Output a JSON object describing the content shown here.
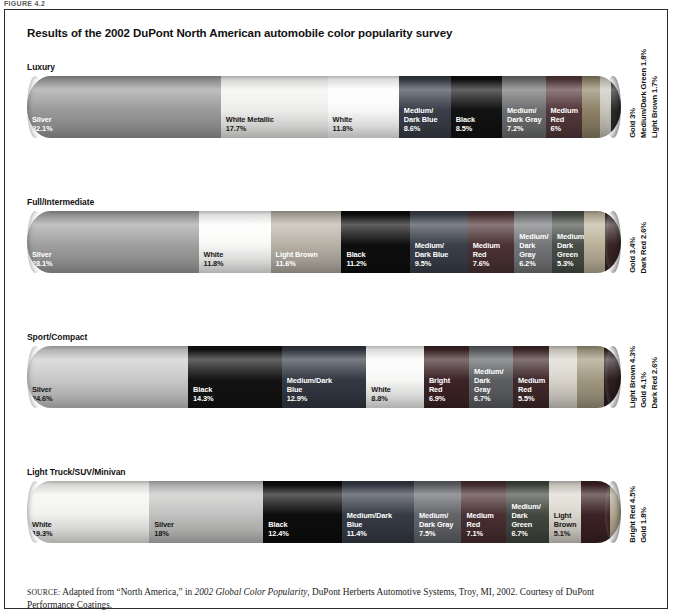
{
  "figure_label": "FIGURE 4.2",
  "title": "Results of the 2002 DuPont North American automobile color popularity survey",
  "source": {
    "prefix": "SOURCE:",
    "text_before_italic": " Adapted from “North America,” in ",
    "italic": "2002 Global Color Popularity",
    "text_after_italic": ", DuPont Herberts Automotive Systems, Troy, MI, 2002. Courtesy of DuPont Performance Coatings."
  },
  "chart_data": {
    "type": "bar",
    "subtype": "stacked-horizontal-100-percent",
    "title": "Results of the 2002 DuPont North American automobile color popularity survey",
    "xlabel": "",
    "ylabel": "",
    "units": "percent",
    "categories": [
      "Luxury",
      "Full/Intermediate",
      "Sport/Compact",
      "Light Truck/SUV/Minivan"
    ],
    "groups": [
      {
        "label": "Luxury",
        "segments": [
          {
            "name": "Silver",
            "value": 32.1,
            "value_label": "32.1%",
            "color": "#9d9d9d",
            "text": "light",
            "inline": true
          },
          {
            "name": "White Metallic",
            "value": 17.7,
            "value_label": "17.7%",
            "color": "#f1f1ef",
            "text": "dark",
            "inline": true
          },
          {
            "name": "White",
            "value": 11.8,
            "value_label": "11.8%",
            "color": "#fdfdfd",
            "text": "dark",
            "inline": true
          },
          {
            "name": "Medium/\nDark Blue",
            "value": 8.6,
            "value_label": "8.6%",
            "color": "#3a3f4a",
            "text": "light",
            "inline": true
          },
          {
            "name": "Black",
            "value": 8.5,
            "value_label": "8.5%",
            "color": "#121212",
            "text": "light",
            "inline": true
          },
          {
            "name": "Medium/\nDark Gray",
            "value": 7.2,
            "value_label": "7.2%",
            "color": "#6e6f70",
            "text": "light",
            "inline": true
          },
          {
            "name": "Medium\nRed",
            "value": 6.0,
            "value_label": "6%",
            "color": "#55393c",
            "text": "light",
            "inline": true
          },
          {
            "name": "Gold",
            "value": 3.0,
            "value_label": "3%",
            "color": "#908468",
            "text": "light",
            "inline": false
          },
          {
            "name": "Medium/Dark Green",
            "value": 1.8,
            "value_label": "1.8%",
            "color": "#c9c7bd",
            "text": "dark",
            "inline": false
          },
          {
            "name": "Light Brown",
            "value": 1.7,
            "value_label": "1.7%",
            "color": "#2b2b2b",
            "text": "light",
            "inline": false
          }
        ],
        "side_labels": [
          "Gold 3%",
          "Medium/Dark Green 1.8%",
          "Light Brown 1.7%"
        ]
      },
      {
        "label": "Full/Intermediate",
        "segments": [
          {
            "name": "Silver",
            "value": 28.1,
            "value_label": "28.1%",
            "color": "#a2a2a2",
            "text": "light",
            "inline": true
          },
          {
            "name": "White",
            "value": 11.8,
            "value_label": "11.8%",
            "color": "#fcfcfb",
            "text": "dark",
            "inline": true
          },
          {
            "name": "Light Brown",
            "value": 11.6,
            "value_label": "11.6%",
            "color": "#b9b3a8",
            "text": "light",
            "inline": true
          },
          {
            "name": "Black",
            "value": 11.2,
            "value_label": "11.2%",
            "color": "#0e0e0e",
            "text": "light",
            "inline": true
          },
          {
            "name": "Medium/\nDark Blue",
            "value": 9.5,
            "value_label": "9.5%",
            "color": "#3b404b",
            "text": "light",
            "inline": true
          },
          {
            "name": "Medium\nRed",
            "value": 7.6,
            "value_label": "7.6%",
            "color": "#4d3335",
            "text": "light",
            "inline": true
          },
          {
            "name": "Medium/\nDark\nGray",
            "value": 6.2,
            "value_label": "6.2%",
            "color": "#76777a",
            "text": "light",
            "inline": true
          },
          {
            "name": "Medium/\nDark\nGreen",
            "value": 5.3,
            "value_label": "5.3%",
            "color": "#4a4f49",
            "text": "light",
            "inline": true
          },
          {
            "name": "Gold",
            "value": 3.4,
            "value_label": "3.4%",
            "color": "#bdb49b",
            "text": "dark",
            "inline": false
          },
          {
            "name": "Dark Red",
            "value": 2.6,
            "value_label": "2.6%",
            "color": "#3a2526",
            "text": "light",
            "inline": false
          }
        ],
        "side_labels": [
          "Gold 3.4%",
          "Dark Red 2.6%"
        ]
      },
      {
        "label": "Sport/Compact",
        "segments": [
          {
            "name": "Silver",
            "value": 24.6,
            "value_label": "24.6%",
            "color": "#cbcbcb",
            "text": "dark",
            "inline": true
          },
          {
            "name": "Black",
            "value": 14.3,
            "value_label": "14.3%",
            "color": "#131313",
            "text": "light",
            "inline": true
          },
          {
            "name": "Medium/Dark\nBlue",
            "value": 12.9,
            "value_label": "12.9%",
            "color": "#343944",
            "text": "light",
            "inline": true
          },
          {
            "name": "White",
            "value": 8.8,
            "value_label": "8.8%",
            "color": "#fbfbfa",
            "text": "dark",
            "inline": true
          },
          {
            "name": "Bright\nRed",
            "value": 6.9,
            "value_label": "6.9%",
            "color": "#3e2426",
            "text": "light",
            "inline": true
          },
          {
            "name": "Medium/\nDark\nGray",
            "value": 6.7,
            "value_label": "6.7%",
            "color": "#5e6063",
            "text": "light",
            "inline": true
          },
          {
            "name": "Medium\nRed",
            "value": 5.5,
            "value_label": "5.5%",
            "color": "#422a2c",
            "text": "light",
            "inline": true
          },
          {
            "name": "Light Brown",
            "value": 4.3,
            "value_label": "4.3%",
            "color": "#dcd8ce",
            "text": "dark",
            "inline": false
          },
          {
            "name": "Gold",
            "value": 4.1,
            "value_label": "4.1%",
            "color": "#a39a82",
            "text": "light",
            "inline": false
          },
          {
            "name": "Dark Red",
            "value": 2.6,
            "value_label": "2.6%",
            "color": "#2e1e20",
            "text": "light",
            "inline": false
          }
        ],
        "side_labels": [
          "Light Brown 4.3%",
          "Gold 4.1%",
          "Dark Red 2.6%"
        ]
      },
      {
        "label": "Light Truck/SUV/Minivan",
        "segments": [
          {
            "name": "White",
            "value": 19.3,
            "value_label": "19.3%",
            "color": "#f4f4f2",
            "text": "dark",
            "inline": true
          },
          {
            "name": "Silver",
            "value": 18.0,
            "value_label": "18%",
            "color": "#c4c4c3",
            "text": "dark",
            "inline": true
          },
          {
            "name": "Black",
            "value": 12.4,
            "value_label": "12.4%",
            "color": "#0d0d0d",
            "text": "light",
            "inline": true
          },
          {
            "name": "Medium/Dark\nBlue",
            "value": 11.4,
            "value_label": "11.4%",
            "color": "#373c47",
            "text": "light",
            "inline": true
          },
          {
            "name": "Medium/\nDark Gray",
            "value": 7.5,
            "value_label": "7.5%",
            "color": "#64666a",
            "text": "light",
            "inline": true
          },
          {
            "name": "Medium\nRed",
            "value": 7.1,
            "value_label": "7.1%",
            "color": "#4a3032",
            "text": "light",
            "inline": true
          },
          {
            "name": "Medium/\nDark\nGreen",
            "value": 6.7,
            "value_label": "6.7%",
            "color": "#434840",
            "text": "light",
            "inline": true
          },
          {
            "name": "Light\nBrown",
            "value": 5.1,
            "value_label": "5.1%",
            "color": "#ddd9cf",
            "text": "dark",
            "inline": true
          },
          {
            "name": "Bright Red",
            "value": 4.5,
            "value_label": "4.5%",
            "color": "#3c2224",
            "text": "light",
            "inline": false
          },
          {
            "name": "Gold",
            "value": 1.8,
            "value_label": "1.8%",
            "color": "#b4ab92",
            "text": "dark",
            "inline": false
          }
        ],
        "side_labels": [
          "Bright Red 4.5%",
          "Gold 1.8%"
        ]
      }
    ]
  }
}
